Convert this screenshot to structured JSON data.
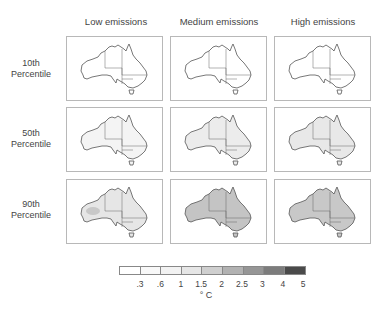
{
  "figure": {
    "columns": [
      "Low emissions",
      "Medium emissions",
      "High emissions"
    ],
    "rows": [
      {
        "line1": "10th",
        "line2": "Percentile"
      },
      {
        "line1": "50th",
        "line2": "Percentile"
      },
      {
        "line1": "90th",
        "line2": "Percentile"
      }
    ],
    "panels": [
      [
        {
          "fill": "#ffffff",
          "hot": "#ffffff"
        },
        {
          "fill": "#ffffff",
          "hot": "#ffffff"
        },
        {
          "fill": "#ffffff",
          "hot": "#ffffff"
        }
      ],
      [
        {
          "fill": "#f4f4f4",
          "hot": "#f0f0f0"
        },
        {
          "fill": "#ececec",
          "hot": "#e6e6e6"
        },
        {
          "fill": "#e8e8e8",
          "hot": "#e0e0e0"
        }
      ],
      [
        {
          "fill": "#e6e6e6",
          "hot": "#c8c8c8"
        },
        {
          "fill": "#c4c4c4",
          "hot": "#b4b4b4"
        },
        {
          "fill": "#c8c8c8",
          "hot": "#b8b8b8"
        }
      ]
    ]
  },
  "legend": {
    "colors": [
      "#ffffff",
      "#f8f8f8",
      "#f2f2f2",
      "#e6e6e6",
      "#cfcfcf",
      "#b2b2b2",
      "#969696",
      "#7c7c7c",
      "#4a4a4a"
    ],
    "ticks": [
      ".3",
      ".6",
      "1",
      "1.5",
      "2",
      "2.5",
      "3",
      "4",
      "5"
    ],
    "unit": "° C"
  }
}
